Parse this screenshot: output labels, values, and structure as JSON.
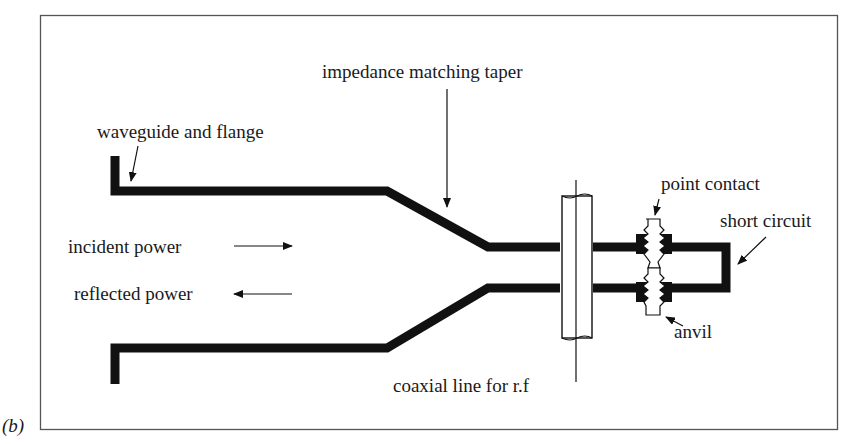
{
  "figure": {
    "panel_label": "(b)",
    "colors": {
      "ink": "#111111",
      "background": "#ffffff",
      "frame": "#555555"
    }
  },
  "labels": {
    "waveguide": "waveguide and flange",
    "taper": "impedance matching taper",
    "incident": "incident power",
    "reflected": "reflected power",
    "coax": "coaxial line for r.f",
    "point_contact": "point contact",
    "short_circuit": "short circuit",
    "anvil": "anvil"
  }
}
